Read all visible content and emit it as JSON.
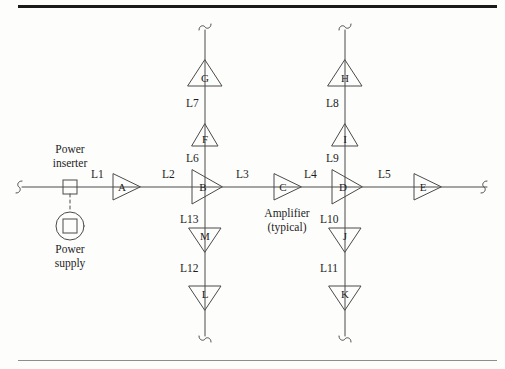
{
  "figure": {
    "type": "cable-distribution-network-diagram",
    "caption_note": "Amplifier (typical)",
    "stroke_color": "#4a4a4a",
    "text_color": "#1d1d1d",
    "rule_color_top": "#1a1a1a",
    "rule_color_bottom": "#8d8d8d"
  },
  "power": {
    "inserter_label_line1": "Power",
    "inserter_label_line2": "inserter",
    "supply_label_line1": "Power",
    "supply_label_line2": "supply"
  },
  "annotations": {
    "amplifier_typical_line1": "Amplifier",
    "amplifier_typical_line2": "(typical)"
  },
  "trunk": {
    "orientation": "horizontal",
    "segments": [
      {
        "id": "L1",
        "label": "L1",
        "x": 150,
        "y": 173
      },
      {
        "id": "L2",
        "label": "L2",
        "x": 230,
        "y": 173
      },
      {
        "id": "L3",
        "label": "L3",
        "x": 310,
        "y": 173
      },
      {
        "id": "L4",
        "label": "L4",
        "x": 390,
        "y": 173
      },
      {
        "id": "L5",
        "label": "L5",
        "x": 462,
        "y": 173
      }
    ],
    "amplifiers": [
      {
        "id": "A",
        "label": "A",
        "cx": 126,
        "cy": 187,
        "direction": "right",
        "size": "small"
      },
      {
        "id": "B",
        "label": "B",
        "cx": 206,
        "cy": 187,
        "direction": "right",
        "size": "large"
      },
      {
        "id": "C",
        "label": "C",
        "cx": 287,
        "cy": 187,
        "direction": "right",
        "size": "small"
      },
      {
        "id": "D",
        "label": "D",
        "cx": 345,
        "cy": 187,
        "direction": "right",
        "size": "large"
      },
      {
        "id": "E",
        "label": "E",
        "cx": 427,
        "cy": 187,
        "direction": "right",
        "size": "small"
      }
    ]
  },
  "branches": [
    {
      "at_amplifier": "B",
      "x": 205,
      "up": {
        "segments": [
          {
            "id": "L6",
            "label": "L6",
            "x": 188,
            "y": 152
          },
          {
            "id": "L7",
            "label": "L7",
            "x": 188,
            "y": 97
          }
        ],
        "amplifiers": [
          {
            "id": "F",
            "label": "F",
            "cx": 205,
            "cy": 134,
            "direction": "up",
            "size": "small"
          },
          {
            "id": "G",
            "label": "G",
            "cx": 205,
            "cy": 74,
            "direction": "up",
            "size": "large"
          }
        ]
      },
      "down": {
        "segments": [
          {
            "id": "L13",
            "label": "L13",
            "x": 186,
            "y": 219
          },
          {
            "id": "L12",
            "label": "L12",
            "x": 186,
            "y": 268
          }
        ],
        "amplifiers": [
          {
            "id": "M",
            "label": "M",
            "cx": 205,
            "cy": 240,
            "direction": "down",
            "size": "large"
          },
          {
            "id": "L",
            "label": "L",
            "cx": 205,
            "cy": 297,
            "direction": "down",
            "size": "large"
          }
        ]
      }
    },
    {
      "at_amplifier": "D",
      "x": 345,
      "up": {
        "segments": [
          {
            "id": "L9",
            "label": "L9",
            "x": 328,
            "y": 152
          },
          {
            "id": "L8",
            "label": "L8",
            "x": 328,
            "y": 97
          }
        ],
        "amplifiers": [
          {
            "id": "I",
            "label": "I",
            "cx": 345,
            "cy": 134,
            "direction": "up",
            "size": "small"
          },
          {
            "id": "H",
            "label": "H",
            "cx": 345,
            "cy": 74,
            "direction": "up",
            "size": "large"
          }
        ]
      },
      "down": {
        "segments": [
          {
            "id": "L10",
            "label": "L10",
            "x": 326,
            "y": 219
          },
          {
            "id": "L11",
            "label": "L11",
            "x": 326,
            "y": 268
          }
        ],
        "amplifiers": [
          {
            "id": "J",
            "label": "J",
            "cx": 345,
            "cy": 240,
            "direction": "down",
            "size": "large"
          },
          {
            "id": "K",
            "label": "K",
            "cx": 345,
            "cy": 297,
            "direction": "down",
            "size": "large"
          }
        ]
      }
    }
  ],
  "terminators": [
    {
      "name": "trunk-left-break",
      "x": 16,
      "y": 187,
      "orientation": "horizontal"
    },
    {
      "name": "trunk-right-break",
      "x": 489,
      "y": 187,
      "orientation": "horizontal"
    },
    {
      "name": "branch-b-top-break",
      "x": 205,
      "y": 25,
      "orientation": "vertical"
    },
    {
      "name": "branch-d-top-break",
      "x": 345,
      "y": 25,
      "orientation": "vertical"
    },
    {
      "name": "branch-b-bottom-break",
      "x": 205,
      "y": 340,
      "orientation": "vertical"
    },
    {
      "name": "branch-d-bottom-break",
      "x": 345,
      "y": 340,
      "orientation": "vertical"
    }
  ]
}
